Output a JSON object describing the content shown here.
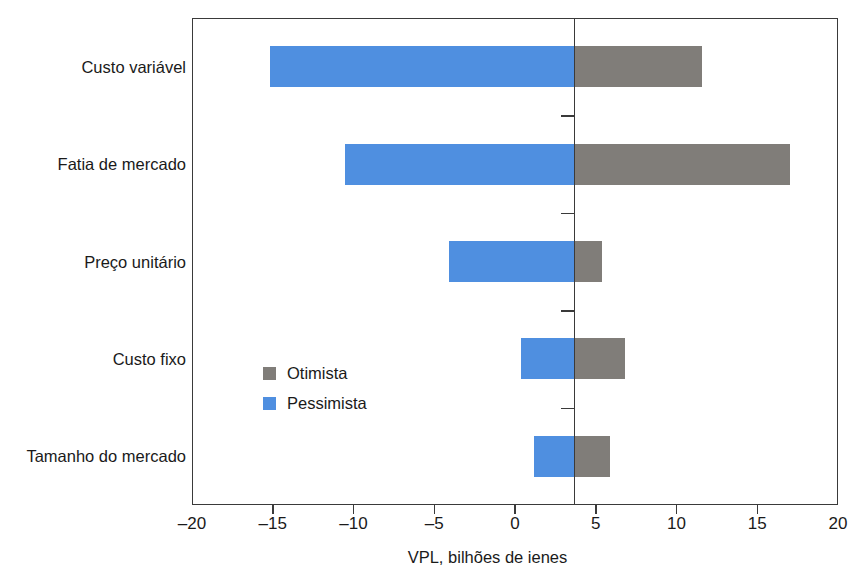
{
  "chart_data": {
    "type": "bar",
    "subtype": "tornado-diverging",
    "title": "",
    "xlabel": "VPL, bilhões de ienes",
    "ylabel": "",
    "xlim": [
      -20,
      20
    ],
    "xticks": [
      -20,
      -15,
      -10,
      -5,
      0,
      5,
      10,
      15,
      20
    ],
    "xtick_labels": [
      "–20",
      "–15",
      "–10",
      "–5",
      "0",
      "5",
      "10",
      "15",
      "20"
    ],
    "grid": false,
    "base_case_value": 3.65,
    "legend_position": "inside-center-left",
    "categories": [
      "Custo variável",
      "Fatia de mercado",
      "Preço unitário",
      "Custo fixo",
      "Tamanho do mercado"
    ],
    "series": [
      {
        "name": "Pessimista",
        "color": "#4f8fe0",
        "values": [
          -15.2,
          -10.5,
          -4.1,
          0.4,
          1.2
        ]
      },
      {
        "name": "Otimista",
        "color": "#807d79",
        "values": [
          11.6,
          17.0,
          5.4,
          6.8,
          5.9
        ]
      }
    ]
  },
  "legend": {
    "items": [
      {
        "label": "Otimista",
        "color": "#807d79"
      },
      {
        "label": "Pessimista",
        "color": "#4f8fe0"
      }
    ]
  },
  "axis": {
    "x_title": "VPL, bilhões de ienes"
  },
  "colors": {
    "optimistic": "#807d79",
    "pessimistic": "#4f8fe0",
    "axis": "#3a3a3a",
    "text": "#1a1a1a",
    "background": "#ffffff"
  }
}
